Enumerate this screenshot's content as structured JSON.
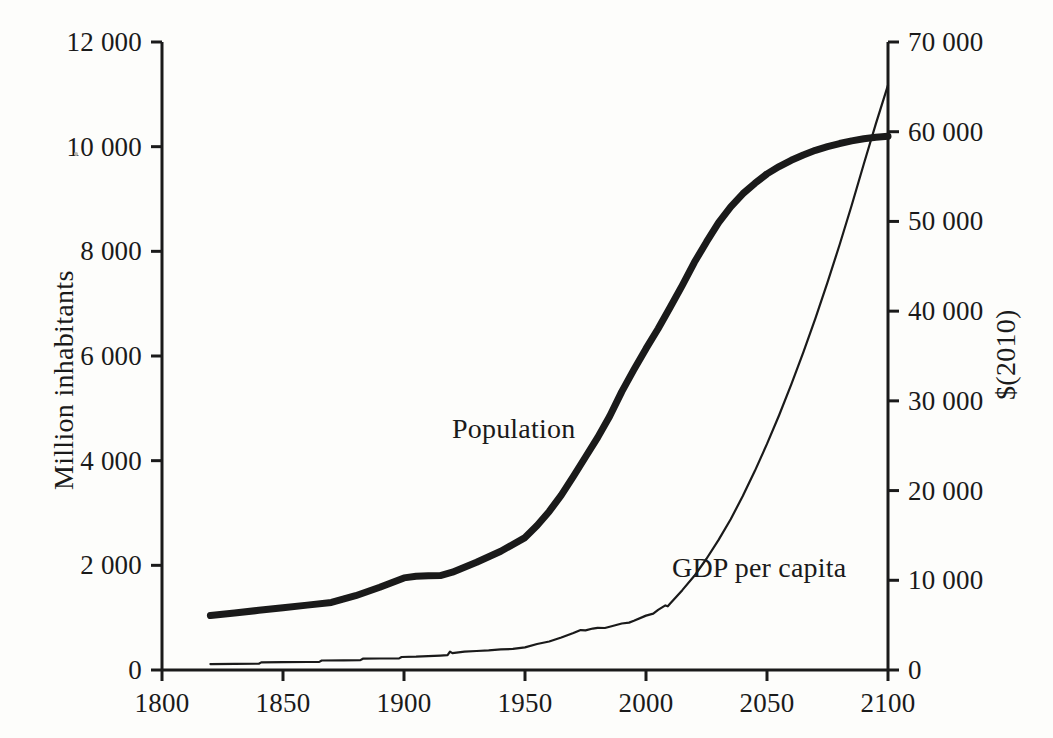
{
  "figure": {
    "background_color": "#fdfdfb",
    "ink_color": "#1a1a1a"
  },
  "axes": {
    "left": {
      "title": "Million inhabitants",
      "ticks": [
        "0",
        "2 000",
        "4 000",
        "6 000",
        "8 000",
        "10 000",
        "12 000"
      ],
      "tick_values": [
        0,
        2000,
        4000,
        6000,
        8000,
        10000,
        12000
      ],
      "min": 0,
      "max": 12000
    },
    "right": {
      "title": "$(2010)",
      "ticks": [
        "0",
        "10 000",
        "20 000",
        "30 000",
        "40 000",
        "50 000",
        "60 000",
        "70 000"
      ],
      "tick_values": [
        0,
        10000,
        20000,
        30000,
        40000,
        50000,
        60000,
        70000
      ],
      "min": 0,
      "max": 70000
    },
    "bottom": {
      "title": "",
      "ticks": [
        "1800",
        "1850",
        "1900",
        "1950",
        "2000",
        "2050",
        "2100"
      ],
      "tick_values": [
        1800,
        1850,
        1900,
        1950,
        2000,
        2050,
        2100
      ],
      "min": 1800,
      "max": 2100
    }
  },
  "series_labels": {
    "population": "Population",
    "gdp": "GDP per capita"
  },
  "chart_data": {
    "type": "line",
    "title": "",
    "xlabel": "",
    "ylabel": "Million inhabitants",
    "y2label": "$(2010)",
    "xlim": [
      1800,
      2100
    ],
    "ylim": [
      0,
      12000
    ],
    "y2lim": [
      0,
      70000
    ],
    "grid": false,
    "legend": "inline-labels",
    "series": [
      {
        "name": "Population",
        "units": "Million inhabitants",
        "axis": "left",
        "line_width": "thick",
        "color": "#1a1a1a",
        "points": [
          [
            1820,
            1040
          ],
          [
            1830,
            1090
          ],
          [
            1840,
            1140
          ],
          [
            1850,
            1190
          ],
          [
            1860,
            1240
          ],
          [
            1870,
            1290
          ],
          [
            1880,
            1420
          ],
          [
            1890,
            1580
          ],
          [
            1900,
            1760
          ],
          [
            1905,
            1790
          ],
          [
            1910,
            1800
          ],
          [
            1915,
            1805
          ],
          [
            1920,
            1870
          ],
          [
            1930,
            2060
          ],
          [
            1940,
            2270
          ],
          [
            1950,
            2530
          ],
          [
            1955,
            2760
          ],
          [
            1960,
            3030
          ],
          [
            1965,
            3340
          ],
          [
            1970,
            3700
          ],
          [
            1975,
            4070
          ],
          [
            1980,
            4440
          ],
          [
            1985,
            4850
          ],
          [
            1990,
            5320
          ],
          [
            1995,
            5740
          ],
          [
            2000,
            6140
          ],
          [
            2005,
            6520
          ],
          [
            2010,
            6930
          ],
          [
            2015,
            7350
          ],
          [
            2020,
            7790
          ],
          [
            2025,
            8180
          ],
          [
            2030,
            8550
          ],
          [
            2035,
            8850
          ],
          [
            2040,
            9100
          ],
          [
            2045,
            9300
          ],
          [
            2050,
            9480
          ],
          [
            2055,
            9620
          ],
          [
            2060,
            9740
          ],
          [
            2065,
            9840
          ],
          [
            2070,
            9930
          ],
          [
            2075,
            10000
          ],
          [
            2080,
            10060
          ],
          [
            2085,
            10110
          ],
          [
            2090,
            10150
          ],
          [
            2095,
            10180
          ],
          [
            2100,
            10200
          ]
        ]
      },
      {
        "name": "GDP per capita",
        "units": "$(2010)",
        "axis": "right",
        "line_width": "thin",
        "color": "#1a1a1a",
        "points": [
          [
            1820,
            660
          ],
          [
            1830,
            680
          ],
          [
            1840,
            700
          ],
          [
            1841,
            850
          ],
          [
            1850,
            870
          ],
          [
            1860,
            890
          ],
          [
            1865,
            910
          ],
          [
            1866,
            1060
          ],
          [
            1875,
            1080
          ],
          [
            1882,
            1100
          ],
          [
            1883,
            1260
          ],
          [
            1890,
            1280
          ],
          [
            1898,
            1300
          ],
          [
            1899,
            1450
          ],
          [
            1905,
            1480
          ],
          [
            1910,
            1540
          ],
          [
            1915,
            1600
          ],
          [
            1918,
            1650
          ],
          [
            1919,
            2050
          ],
          [
            1920,
            1880
          ],
          [
            1925,
            2050
          ],
          [
            1930,
            2120
          ],
          [
            1935,
            2180
          ],
          [
            1940,
            2300
          ],
          [
            1945,
            2350
          ],
          [
            1950,
            2520
          ],
          [
            1955,
            2900
          ],
          [
            1960,
            3180
          ],
          [
            1965,
            3620
          ],
          [
            1970,
            4120
          ],
          [
            1973,
            4450
          ],
          [
            1975,
            4420
          ],
          [
            1978,
            4620
          ],
          [
            1980,
            4700
          ],
          [
            1983,
            4680
          ],
          [
            1985,
            4820
          ],
          [
            1990,
            5180
          ],
          [
            1993,
            5280
          ],
          [
            1995,
            5480
          ],
          [
            2000,
            6060
          ],
          [
            2003,
            6280
          ],
          [
            2005,
            6700
          ],
          [
            2008,
            7200
          ],
          [
            2009,
            7100
          ],
          [
            2010,
            7400
          ],
          [
            2015,
            8900
          ],
          [
            2020,
            10500
          ],
          [
            2025,
            12400
          ],
          [
            2030,
            14500
          ],
          [
            2035,
            16800
          ],
          [
            2040,
            19400
          ],
          [
            2045,
            22200
          ],
          [
            2050,
            25200
          ],
          [
            2055,
            28400
          ],
          [
            2060,
            31800
          ],
          [
            2065,
            35400
          ],
          [
            2070,
            39200
          ],
          [
            2075,
            43200
          ],
          [
            2080,
            47400
          ],
          [
            2085,
            51800
          ],
          [
            2090,
            56400
          ],
          [
            2095,
            60900
          ],
          [
            2100,
            65200
          ]
        ]
      }
    ],
    "annotations": [
      {
        "text": "Population",
        "x": 1963,
        "y_left": 4450
      },
      {
        "text": "GDP per capita",
        "x": 2040,
        "y_right": 10200
      }
    ]
  }
}
